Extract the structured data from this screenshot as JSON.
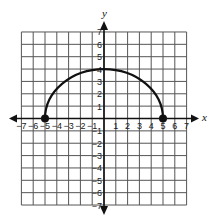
{
  "chart_data": {
    "type": "line",
    "title": "",
    "xlabel": "x",
    "ylabel": "y",
    "xlim": [
      -7,
      7
    ],
    "ylim": [
      -7,
      7
    ],
    "grid": true,
    "x_ticks": [
      -7,
      -6,
      -5,
      -4,
      -3,
      -2,
      -1,
      1,
      2,
      3,
      4,
      5,
      6,
      7
    ],
    "y_ticks": [
      7,
      6,
      5,
      4,
      3,
      2,
      1,
      -1,
      -2,
      -3,
      -4,
      -5,
      -6,
      -7
    ],
    "series": [
      {
        "name": "semicircle",
        "description": "Upper semi-ellipse from (-5,0) to (5,0) with peak near (0,4)",
        "center": [
          0,
          0
        ],
        "x_radius": 5,
        "y_radius": 4,
        "x": [
          -5,
          -4,
          -3,
          -2,
          -1,
          0,
          1,
          2,
          3,
          4,
          5
        ],
        "y": [
          0,
          2.4,
          3.2,
          3.67,
          3.92,
          4,
          3.92,
          3.67,
          3.2,
          2.4,
          0
        ],
        "color": "#111111"
      }
    ],
    "points": [
      {
        "x": -5,
        "y": 0,
        "style": "closed-dot"
      },
      {
        "x": 5,
        "y": 0,
        "style": "closed-dot"
      }
    ],
    "axes_arrows": true
  },
  "colors": {
    "grid": "#555555",
    "axis": "#111111",
    "curve": "#111111",
    "background": "#ffffff"
  }
}
